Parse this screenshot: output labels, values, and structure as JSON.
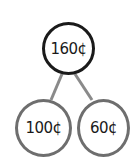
{
  "diagram": {
    "type": "number-bond",
    "whole": {
      "label": "160¢"
    },
    "parts": [
      {
        "label": "100¢"
      },
      {
        "label": "60¢"
      }
    ],
    "colors": {
      "whole_border": "#1a1a1a",
      "part_border": "#6e6e6e",
      "connector": "#8a8a8a"
    }
  }
}
